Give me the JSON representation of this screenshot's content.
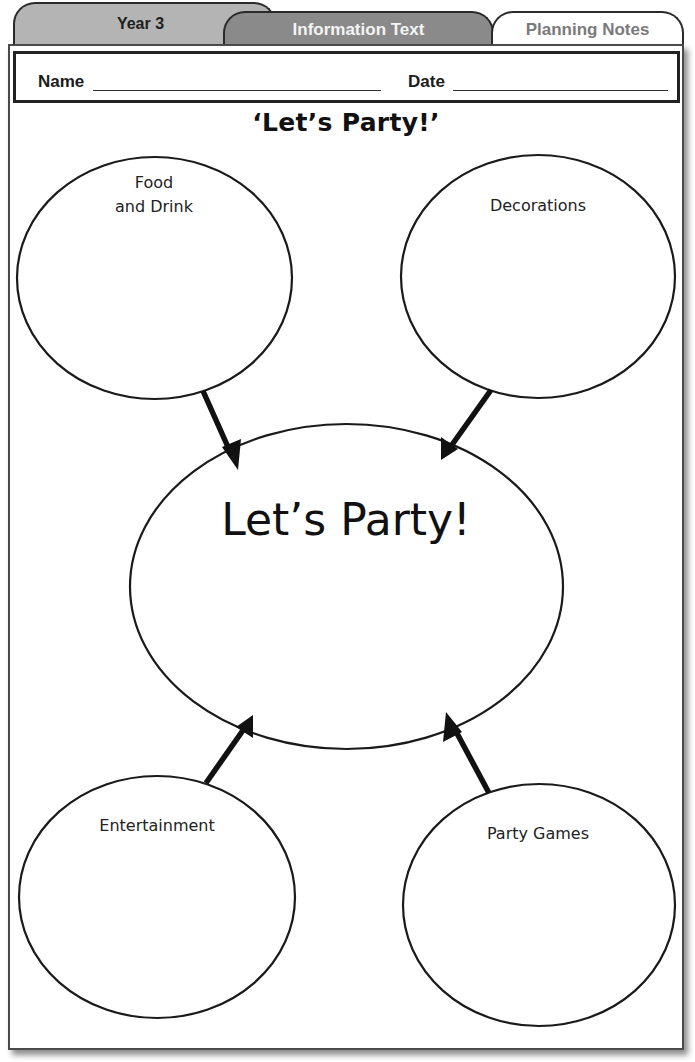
{
  "tabs": {
    "year": "Year 3",
    "info": "Information Text",
    "notes": "Planning Notes"
  },
  "header": {
    "name_label": "Name",
    "name_value": "",
    "date_label": "Date",
    "date_value": ""
  },
  "title": "‘Let’s Party!’",
  "diagram": {
    "center": "Let’s Party!",
    "bubbles": [
      {
        "id": "food",
        "line1": "Food",
        "line2": "and Drink"
      },
      {
        "id": "decorations",
        "line1": "Decorations",
        "line2": ""
      },
      {
        "id": "entertainment",
        "line1": "Entertainment",
        "line2": ""
      },
      {
        "id": "games",
        "line1": "Party Games",
        "line2": ""
      }
    ]
  },
  "colors": {
    "tab_year": "#b4b4b4",
    "tab_info": "#8a8a8a",
    "tab_notes": "#ffffff",
    "ink": "#111111"
  }
}
